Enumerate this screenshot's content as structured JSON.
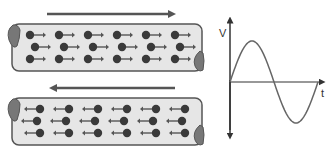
{
  "diagram": {
    "colors": {
      "tube_fill": "#e6e6e6",
      "tube_stroke": "#555555",
      "tube_end": "#777777",
      "electron": "#3a3a3a",
      "arrow": "#555555",
      "curve": "#666666",
      "axis": "#333333"
    },
    "wires": [
      {
        "name": "wire-top",
        "flow_direction": "right",
        "electron_rows": [
          6,
          6,
          6
        ]
      },
      {
        "name": "wire-bottom",
        "flow_direction": "left",
        "electron_rows": [
          6,
          6,
          6
        ]
      }
    ],
    "graph": {
      "y_axis_label": "V",
      "x_axis_label": "t",
      "curve": "sine",
      "cycles": 1
    }
  }
}
